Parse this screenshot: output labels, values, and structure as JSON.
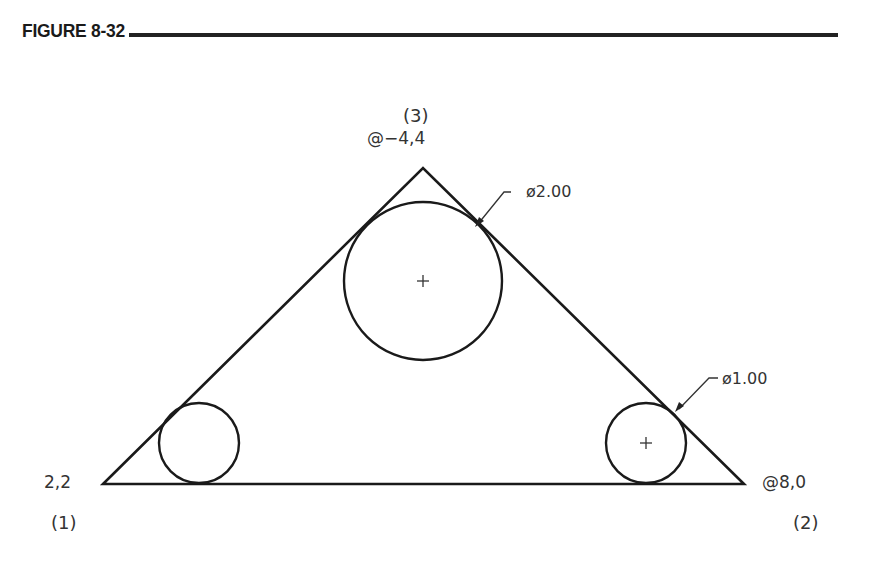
{
  "figure": {
    "title": "FIGURE 8-32"
  },
  "labels": {
    "point3_number": "(3)",
    "point3_coord": "@−4,4",
    "point1_coord": "2,2",
    "point1_number": "(1)",
    "point2_coord": "@8,0",
    "point2_number": "(2)",
    "dim_large": "ø2.00",
    "dim_small": "ø1.00"
  },
  "geometry": {
    "triangle": {
      "vertices": [
        {
          "id": 1,
          "coord": "2,2"
        },
        {
          "id": 2,
          "coord": "@8,0"
        },
        {
          "id": 3,
          "coord": "@-4,4"
        }
      ]
    },
    "circles": [
      {
        "name": "large-circle",
        "diameter": "2.00",
        "center_mark": true
      },
      {
        "name": "left-small-circle",
        "diameter": "1.00",
        "center_mark": false
      },
      {
        "name": "right-small-circle",
        "diameter": "1.00",
        "center_mark": true
      }
    ]
  }
}
